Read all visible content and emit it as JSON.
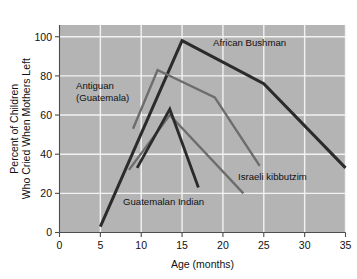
{
  "chart_data": {
    "type": "line",
    "title": "",
    "subtitle": "",
    "xlabel": "Age (months)",
    "ylabel": "Percent of Children Who Cried When Mothers Left",
    "ylabel_lines": [
      "Percent of Children",
      "Who Cried When Mothers Left"
    ],
    "xlim": [
      0,
      35
    ],
    "ylim": [
      0,
      106
    ],
    "xticks": [
      0,
      5,
      10,
      15,
      20,
      25,
      30,
      35
    ],
    "xtick_labels": [
      "0",
      "5",
      "10",
      "15",
      "20",
      "25",
      "30",
      "35"
    ],
    "yticks": [
      0,
      20,
      40,
      60,
      80,
      100
    ],
    "ytick_labels": [
      "0",
      "20",
      "40",
      "60",
      "80",
      "100"
    ],
    "grid": true,
    "grid_color": "#f2f2f2",
    "plot_background": "#b4b4b4",
    "legend_position": "inline-annotations",
    "series": [
      {
        "name": "African Bushman",
        "color": "#2b2b2b",
        "width": 3.0,
        "points": [
          [
            5,
            3
          ],
          [
            15,
            98
          ],
          [
            25,
            76
          ],
          [
            35,
            33
          ]
        ]
      },
      {
        "name": "Antiguan (Guatemala)",
        "color": "#6d6d6d",
        "width": 2.4,
        "points": [
          [
            9,
            53
          ],
          [
            12,
            83
          ],
          [
            19,
            69
          ],
          [
            24.5,
            34
          ]
        ]
      },
      {
        "name": "Israeli kibbutzim",
        "color": "#6d6d6d",
        "width": 2.4,
        "points": [
          [
            8.5,
            32
          ],
          [
            13.5,
            60
          ],
          [
            22.5,
            20
          ]
        ]
      },
      {
        "name": "Guatemalan Indian",
        "color": "#2b2b2b",
        "width": 2.8,
        "points": [
          [
            9.5,
            33
          ],
          [
            13.5,
            63
          ],
          [
            17,
            23
          ]
        ]
      }
    ],
    "annotations": [
      {
        "name": "African Bushman",
        "lines": [
          "African Bushman"
        ],
        "x_px": 213,
        "y_px": 46,
        "anchor": "start"
      },
      {
        "name": "Antiguan (Guatemala)",
        "lines": [
          "Antiguan",
          "(Guatemala)"
        ],
        "x_px": 76,
        "y_px": 89,
        "anchor": "start"
      },
      {
        "name": "Israeli kibbutzim",
        "lines": [
          "Israeli kibbutzim"
        ],
        "x_px": 238,
        "y_px": 180,
        "anchor": "start"
      },
      {
        "name": "Guatemalan Indian",
        "lines": [
          "Guatemalan Indian"
        ],
        "x_px": 123,
        "y_px": 205,
        "anchor": "start"
      }
    ]
  }
}
